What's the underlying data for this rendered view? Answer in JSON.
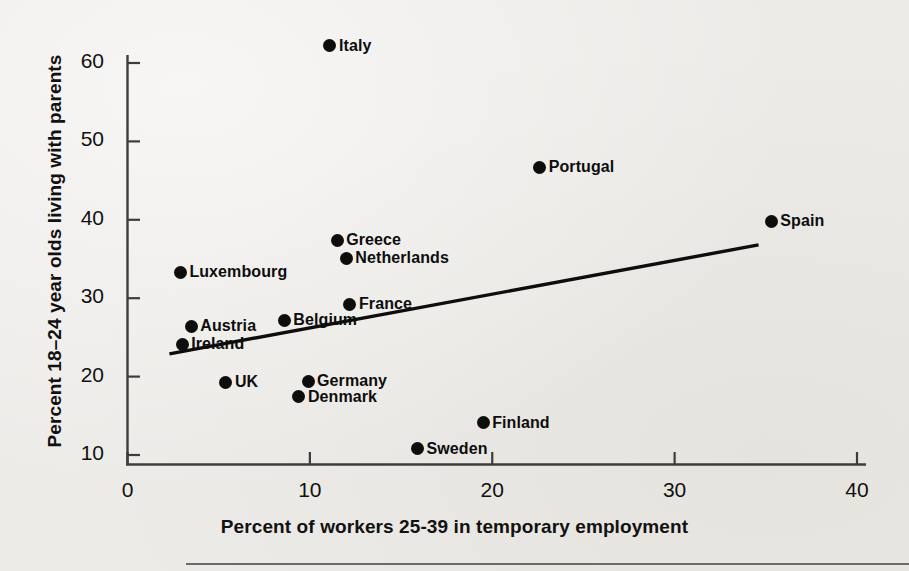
{
  "chart_data": {
    "type": "scatter",
    "title": "",
    "xlabel": "Percent of workers 25-39 in temporary employment",
    "ylabel": "Percent 18–24 year olds living with parents",
    "xlim": [
      0,
      40
    ],
    "ylim": [
      8.2,
      63.5
    ],
    "xticks": [
      0,
      10,
      20,
      30,
      40
    ],
    "yticks": [
      10,
      20,
      30,
      40,
      50,
      60
    ],
    "xtick_labels": [
      "0",
      "10",
      "20",
      "30",
      "40"
    ],
    "ytick_labels": [
      "10",
      "20",
      "30",
      "40",
      "50",
      "60"
    ],
    "grid": false,
    "legend": false,
    "marker": "filled-circle",
    "marker_color": "#0d0d0d",
    "points": [
      {
        "label": "Italy",
        "x": 11.1,
        "y": 62.2,
        "label_side": "right"
      },
      {
        "label": "Portugal",
        "x": 22.6,
        "y": 46.7,
        "label_side": "right"
      },
      {
        "label": "Spain",
        "x": 35.3,
        "y": 39.8,
        "label_side": "right"
      },
      {
        "label": "Greece",
        "x": 11.5,
        "y": 37.4,
        "label_side": "right"
      },
      {
        "label": "Netherlands",
        "x": 12.0,
        "y": 35.1,
        "label_side": "right"
      },
      {
        "label": "Luxembourg",
        "x": 2.9,
        "y": 33.3,
        "label_side": "right"
      },
      {
        "label": "France",
        "x": 12.2,
        "y": 29.2,
        "label_side": "right"
      },
      {
        "label": "Belgium",
        "x": 8.6,
        "y": 27.2,
        "label_side": "right"
      },
      {
        "label": "Austria",
        "x": 3.5,
        "y": 26.4,
        "label_side": "right"
      },
      {
        "label": "Ireland",
        "x": 3.0,
        "y": 24.1,
        "label_side": "right"
      },
      {
        "label": "Germany",
        "x": 9.9,
        "y": 19.4,
        "label_side": "right"
      },
      {
        "label": "UK",
        "x": 5.4,
        "y": 19.3,
        "label_side": "right"
      },
      {
        "label": "Denmark",
        "x": 9.4,
        "y": 17.4,
        "label_side": "right"
      },
      {
        "label": "Finland",
        "x": 19.5,
        "y": 14.1,
        "label_side": "right"
      },
      {
        "label": "Sweden",
        "x": 15.9,
        "y": 10.8,
        "label_side": "right"
      }
    ],
    "trend_line": {
      "type": "linear-fit",
      "x_start": 2.3,
      "y_start": 22.9,
      "x_end": 34.6,
      "y_end": 36.8,
      "color": "#0d0d0d"
    },
    "colors": {
      "axis": "#3d3d3d",
      "text": "#111111",
      "background": "#edebe8",
      "marker": "#0d0d0d"
    }
  }
}
